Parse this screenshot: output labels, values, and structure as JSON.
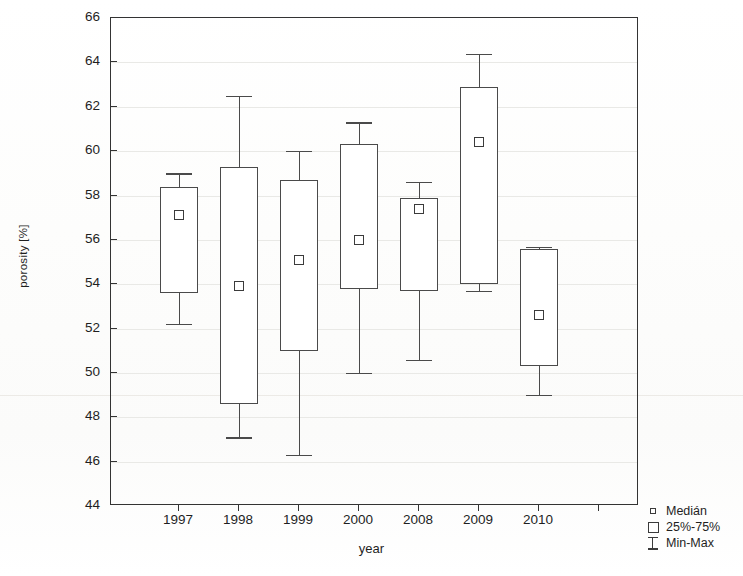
{
  "chart_data": {
    "type": "box",
    "title": "",
    "xlabel": "year",
    "ylabel": "porosity [%]",
    "ylim": [
      44,
      66
    ],
    "yticks": [
      44,
      46,
      48,
      50,
      52,
      54,
      56,
      58,
      60,
      62,
      64,
      66
    ],
    "grid": true,
    "categories": [
      "1997",
      "1998",
      "1999",
      "2000",
      "2008",
      "2009",
      "2010"
    ],
    "boxes": [
      {
        "category": "1997",
        "min": 52.2,
        "q1": 53.6,
        "median": 57.1,
        "q3": 58.4,
        "max": 59.0
      },
      {
        "category": "1998",
        "min": 47.1,
        "q1": 48.6,
        "median": 53.9,
        "q3": 59.3,
        "max": 62.5
      },
      {
        "category": "1999",
        "min": 46.3,
        "q1": 51.0,
        "median": 55.1,
        "q3": 58.7,
        "max": 60.0
      },
      {
        "category": "2000",
        "min": 50.0,
        "q1": 53.8,
        "median": 56.0,
        "q3": 60.3,
        "max": 61.3
      },
      {
        "category": "2008",
        "min": 50.6,
        "q1": 53.7,
        "median": 57.4,
        "q3": 57.9,
        "max": 58.6
      },
      {
        "category": "2009",
        "min": 53.7,
        "q1": 54.0,
        "median": 60.4,
        "q3": 62.9,
        "max": 64.4
      },
      {
        "category": "2010",
        "min": 49.0,
        "q1": 50.3,
        "median": 52.6,
        "q3": 55.6,
        "max": 55.7
      }
    ],
    "legend": {
      "position": "bottom-right",
      "entries": [
        {
          "key": "median-marker",
          "label": "Medián"
        },
        {
          "key": "box-range",
          "label": "25%-75%"
        },
        {
          "key": "whisker-range",
          "label": "Min-Max"
        }
      ]
    },
    "colors": {
      "line": "#4a4a4a",
      "axis": "#333333",
      "grid": "#e9e9e6",
      "background": "#ffffff"
    }
  }
}
